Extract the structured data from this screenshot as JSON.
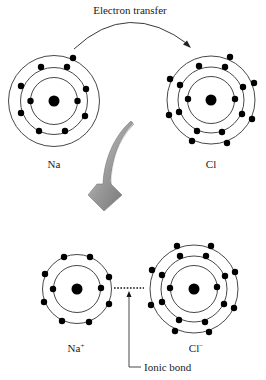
{
  "labels": {
    "transfer": "Electron transfer",
    "na": "Na",
    "cl": "Cl",
    "na_ion": "Na",
    "na_ion_sup": "+",
    "cl_ion": "Cl",
    "cl_ion_sup": "−",
    "ionic_bond": "Ionic bond"
  },
  "atoms": [
    {
      "id": "na",
      "symbol": "Na",
      "shells": [
        2,
        8,
        1
      ]
    },
    {
      "id": "cl",
      "symbol": "Cl",
      "shells": [
        2,
        8,
        7
      ]
    },
    {
      "id": "na-ion",
      "symbol": "Na+",
      "shells": [
        2,
        8
      ]
    },
    {
      "id": "cl-ion",
      "symbol": "Cl−",
      "shells": [
        2,
        8,
        8
      ]
    }
  ],
  "colors": {
    "line": "#333333",
    "electron": "#000000",
    "arrow_gray": "#8a8a8a"
  }
}
